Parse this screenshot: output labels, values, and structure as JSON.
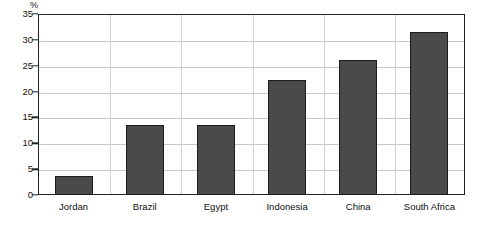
{
  "chart_data": {
    "type": "bar",
    "title": "",
    "subtitle": "",
    "xlabel": "",
    "ylabel": "%",
    "unit_label": "%",
    "categories": [
      "Jordan",
      "Brazil",
      "Egypt",
      "Indonesia",
      "China",
      "South Africa"
    ],
    "values": [
      3.6,
      13.5,
      13.5,
      22.2,
      26.2,
      31.5
    ],
    "series": [
      {
        "name": "",
        "values": [
          3.6,
          13.5,
          13.5,
          22.2,
          26.2,
          31.5
        ]
      }
    ],
    "ylim": [
      0,
      35
    ],
    "yticks": [
      0,
      5,
      10,
      15,
      20,
      25,
      30,
      35
    ],
    "ytick_labels": [
      "0",
      "5",
      "10",
      "15",
      "20",
      "25",
      "30",
      "35"
    ],
    "grid": true,
    "grid_axis": "both",
    "legend": false,
    "legend_position": "none",
    "annotations": [],
    "colors": {
      "bar_fill": "#4a4a4a",
      "bar_edge": "#1c1c1c",
      "grid": "#c8c8c8",
      "axis": "#222222",
      "text": "#111111",
      "background": "#ffffff"
    }
  }
}
